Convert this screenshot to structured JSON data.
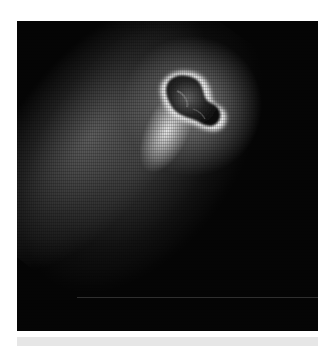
{
  "image": {
    "subject": "comet nucleus with coma and dust jet",
    "palette": {
      "background": "#050505",
      "coma": "#8a8a8a",
      "halo": "#f0f0f0",
      "nucleus_dark": "#1a1a1a",
      "page": "#ffffff",
      "band": "#e6e6e6"
    }
  }
}
